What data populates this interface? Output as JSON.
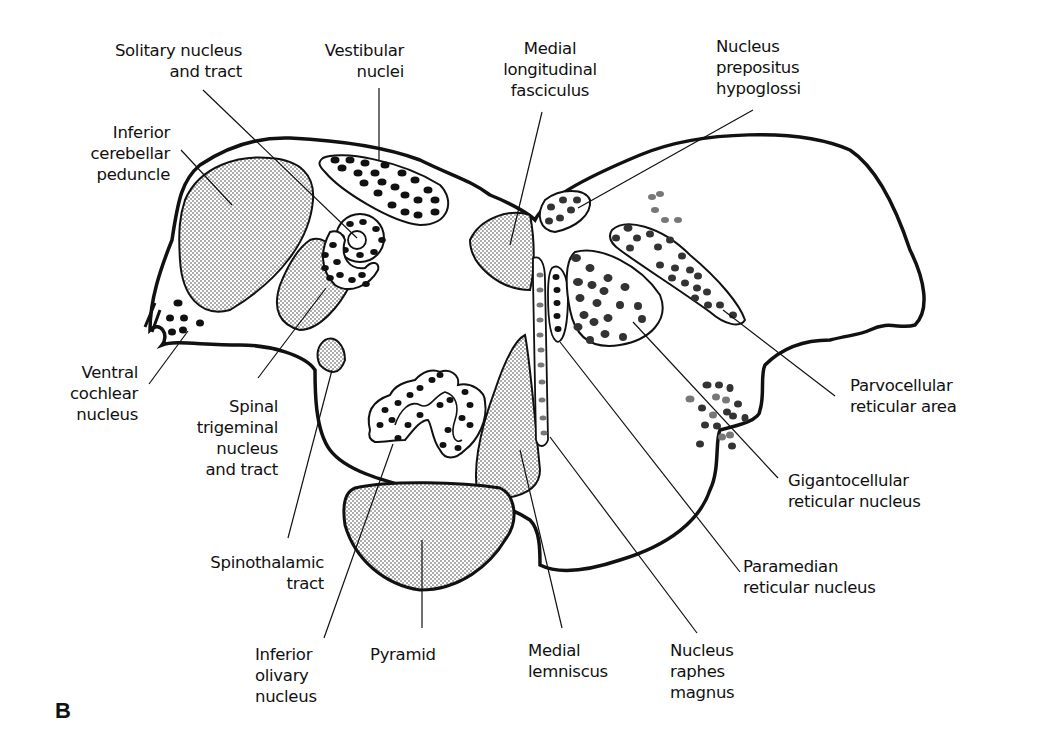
{
  "figure": {
    "panel_letter": "B"
  },
  "labels": {
    "solitary": "Solitary nucleus\nand tract",
    "vestibular": "Vestibular\nnuclei",
    "mlf": "Medial\nlongitudinal\nfasciculus",
    "prepositus": "Nucleus\nprepositus\nhypoglossi",
    "icp": "Inferior\ncerebellar\npeduncle",
    "vcn": "Ventral\ncochlear\nnucleus",
    "spinal_trig": "Spinal\ntrigeminal\nnucleus\nand tract",
    "spinothalamic": "Spinothalamic\ntract",
    "ion": "Inferior\nolivary\nnucleus",
    "pyramid": "Pyramid",
    "ml": "Medial\nlemniscus",
    "raphes": "Nucleus\nraphes\nmagnus",
    "parvo": "Parvocellular\nreticular area",
    "giganto": "Gigantocellular\nreticular nucleus",
    "paramedian": "Paramedian\nreticular nucleus"
  },
  "colors": {
    "ink": "#111111",
    "stipple": "#333333",
    "gray_dot": "#777777",
    "background": "#ffffff"
  }
}
